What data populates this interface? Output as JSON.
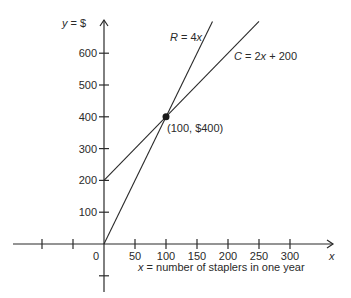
{
  "chart_data": {
    "type": "line",
    "title": "",
    "xlabel": "x = number of staplers in one year",
    "ylabel": "y = $",
    "x_axis_name": "x",
    "x_ticks": [
      -100,
      -50,
      0,
      50,
      100,
      150,
      200,
      250,
      300
    ],
    "x_tick_labels": [
      "",
      "",
      "0",
      "50",
      "100",
      "150",
      "200",
      "250",
      "300"
    ],
    "y_ticks": [
      -100,
      100,
      200,
      300,
      400,
      500,
      600
    ],
    "y_tick_labels": [
      "",
      "100",
      "200",
      "300",
      "400",
      "500",
      "600"
    ],
    "xlim": [
      -150,
      350
    ],
    "ylim": [
      -150,
      700
    ],
    "grid": false,
    "series": [
      {
        "name": "R = 4x",
        "equation": "R = 4x",
        "x": [
          0,
          175
        ],
        "y": [
          0,
          700
        ]
      },
      {
        "name": "C = 2x + 200",
        "equation": "C = 2x + 200",
        "x": [
          0,
          250
        ],
        "y": [
          200,
          700
        ]
      }
    ],
    "annotations": [
      {
        "type": "point",
        "x": 100,
        "y": 400,
        "label": "(100, $400)"
      }
    ]
  },
  "labels": {
    "y_axis": "y = $",
    "x_axis": "x",
    "x_caption": "x = number of staplers in one year",
    "series_r": "R = 4x",
    "series_c": "C = 2x + 200",
    "point": "(100, $400)",
    "origin": "0"
  },
  "colors": {
    "ink": "#2a2a2a",
    "background": "#ffffff"
  }
}
